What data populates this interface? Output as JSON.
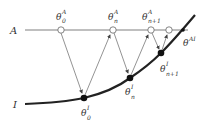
{
  "diagram": {
    "lines": {
      "A": {
        "label": "A"
      },
      "I": {
        "label": "I"
      }
    },
    "labels": {
      "theta0A": {
        "base": "θ",
        "sup": "A",
        "sub": "0"
      },
      "thetanA": {
        "base": "θ",
        "sup": "A",
        "sub": "n"
      },
      "thetan1A": {
        "base": "θ",
        "sup": "A",
        "sub": "n+1"
      },
      "thetaAI": {
        "base": "θ",
        "sup": "AI"
      },
      "theta0I": {
        "base": "θ",
        "sup": "I",
        "sub": "0"
      },
      "thetanI": {
        "base": "θ",
        "sup": "I",
        "sub": "n"
      },
      "thetan1I": {
        "base": "θ",
        "sup": "I",
        "sub": "n+1"
      }
    },
    "colors": {
      "line": "#333333",
      "thin": "#777777",
      "open_point": "#ffffff",
      "filled_point": "#111111"
    }
  }
}
